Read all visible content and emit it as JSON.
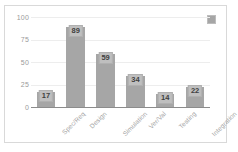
{
  "chart_data": {
    "type": "bar",
    "title": "",
    "subtitle": "",
    "xlabel": "",
    "ylabel": "",
    "categories": [
      "Spec/Req",
      "Design",
      "Simulation",
      "Ver/Val",
      "Testing",
      "Integration"
    ],
    "values": [
      17,
      89,
      59,
      34,
      14,
      22
    ],
    "series": [
      {
        "name": "",
        "values": [
          17,
          89,
          59,
          34,
          14,
          22
        ]
      }
    ],
    "ylim": [
      0,
      100
    ],
    "yticks": [
      0,
      25,
      50,
      75,
      100
    ],
    "ytick_labels": [
      "0",
      "25",
      "50",
      "75",
      "100"
    ],
    "grid": true,
    "grid_axis": "y",
    "legend_position": "top-right",
    "legend_entries": [
      {
        "label": "",
        "color": "#a6a6a6"
      }
    ],
    "data_labels_shown": true,
    "xtick_rotation": -45,
    "colors": {
      "bar": "#a6a6a6",
      "data_label_bg": "#bfbfbf",
      "data_label_text": "#3f3f3f",
      "gridline": "#ededed",
      "axis_line": "#8c8c8c",
      "tick_text": "#9a9a9a",
      "frame_border": "#d9d9d9",
      "background": "#ffffff"
    }
  }
}
